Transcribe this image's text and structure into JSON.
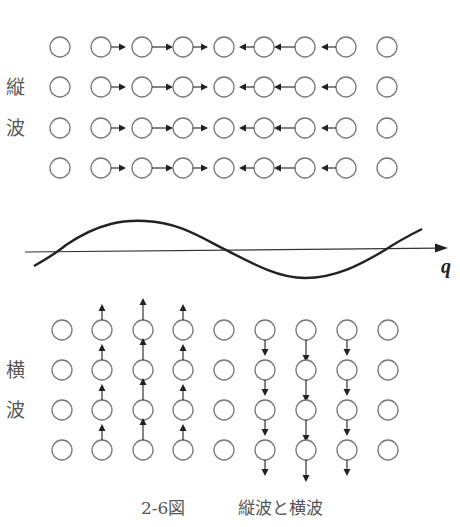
{
  "figure": {
    "caption": "2-6図　縦波と横波",
    "caption_number": "2-6図",
    "caption_title": "縦波と横波",
    "colors": {
      "line": "#222222",
      "atom_stroke": "#777777",
      "text": "#555555",
      "background": "#ffffff"
    }
  },
  "longitudinal": {
    "label_chars": [
      "縦",
      "波"
    ],
    "label": "縦波",
    "columns_x": [
      60,
      101,
      142,
      183,
      224,
      264,
      305,
      346,
      387
    ],
    "rows_y": [
      47,
      87,
      128,
      168
    ],
    "radius": 10,
    "displacement_direction": [
      "none",
      "right",
      "right",
      "right",
      "none",
      "left",
      "left",
      "left",
      "none"
    ],
    "arrow_lengths": [
      0,
      8,
      14,
      8,
      0,
      8,
      14,
      8,
      0
    ]
  },
  "wave": {
    "axis_label": "q",
    "axis": {
      "x1": 25,
      "y1": 252,
      "x2": 448,
      "y2": 248
    },
    "curve_path": "M34,266 C50,257 60,250 66,245 C100,222 125,220 145,221 C180,222 205,240 228,251 C255,265 280,278 305,278 C335,278 360,265 385,250 C400,240 412,234 422,229"
  },
  "transverse": {
    "label_chars": [
      "横",
      "波"
    ],
    "label": "横波",
    "columns_x": [
      62,
      102,
      143,
      183,
      224,
      265,
      306,
      347,
      388
    ],
    "rows_y": [
      330,
      370,
      410,
      450
    ],
    "radius": 10,
    "displacement_direction": [
      "none",
      "up",
      "up",
      "up",
      "none",
      "down",
      "down",
      "down",
      "none"
    ],
    "arrow_lengths": [
      0,
      9,
      15,
      9,
      0,
      9,
      15,
      9,
      0
    ]
  }
}
